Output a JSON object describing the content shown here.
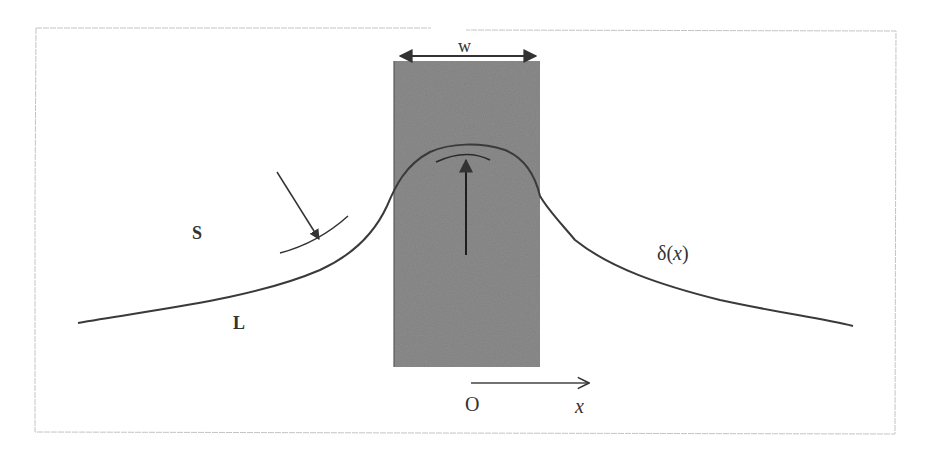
{
  "figure": {
    "type": "meniscus-over-plate schematic",
    "labels": {
      "width": "w",
      "solid": "S",
      "liquid": "L",
      "profile": "δ(x)",
      "profile_symbol": "δ",
      "profile_open": "(",
      "profile_var": "x",
      "profile_close": ")",
      "origin": "O",
      "axis": "x"
    },
    "colors": {
      "background": "#ffffff",
      "frame": "#bbbbbb",
      "plate_fill": "#8a8a8a",
      "plate_edge": "#555555",
      "curve": "#3a3a3a",
      "arrow": "#333333",
      "text": "#333333"
    }
  }
}
